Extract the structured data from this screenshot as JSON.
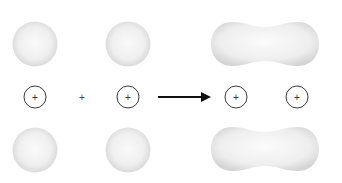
{
  "diagram": {
    "colors": {
      "orbital_fill_center": "#fafafa",
      "orbital_fill_edge": "#dcdcdc",
      "nucleus_stroke": "#333333",
      "arrow": "#111111",
      "background": "#ffffff"
    },
    "left": {
      "atom_1": {
        "nucleus_symbol": "+",
        "cx": 35,
        "cy": 97
      },
      "operator": "+",
      "atom_2": {
        "nucleus_symbol": "+",
        "cx": 128,
        "cy": 97
      }
    },
    "arrow": {
      "symbol": "→"
    },
    "right": {
      "nucleus_1": {
        "nucleus_symbol": "+",
        "cx": 236,
        "cy": 97
      },
      "nucleus_2": {
        "nucleus_symbol": "+",
        "cx": 297,
        "cy": 97
      }
    }
  }
}
